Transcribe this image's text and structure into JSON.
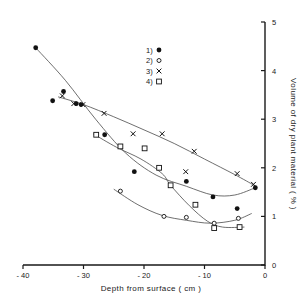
{
  "chart_data": {
    "type": "scatter",
    "title": "",
    "subtitle": "",
    "xlabel": "Depth from surface ( cm )",
    "ylabel": "Volume of dry plant material ( % )",
    "xlim": [
      -40,
      0
    ],
    "ylim": [
      0,
      5
    ],
    "xticks": [
      -40,
      -30,
      -20,
      -10,
      0
    ],
    "xtick_labels": [
      "- 40",
      "- 30",
      "- 20",
      "- 10",
      "0"
    ],
    "yticks": [
      0,
      1,
      2,
      3,
      4,
      5
    ],
    "ytick_labels": [
      "0",
      "1",
      "2",
      "3",
      "4",
      "5"
    ],
    "grid": false,
    "legend_position": "upper-center",
    "yaxis_position": "right",
    "legend": [
      {
        "key": "1)",
        "marker": "filled-circle",
        "series": "1"
      },
      {
        "key": "2)",
        "marker": "open-circle",
        "series": "2"
      },
      {
        "key": "3)",
        "marker": "cross",
        "series": "3"
      },
      {
        "key": "4)",
        "marker": "open-square",
        "series": "4"
      }
    ],
    "series": [
      {
        "name": "1",
        "marker": "filled-circle",
        "points": [
          {
            "x": -37.9,
            "y": 4.47
          },
          {
            "x": -35.1,
            "y": 3.38
          },
          {
            "x": -33.3,
            "y": 3.57
          },
          {
            "x": -31.2,
            "y": 3.32
          },
          {
            "x": -30.4,
            "y": 3.3
          },
          {
            "x": -26.5,
            "y": 2.68
          },
          {
            "x": -21.6,
            "y": 1.92
          },
          {
            "x": -13.0,
            "y": 1.72
          },
          {
            "x": -8.6,
            "y": 1.4
          },
          {
            "x": -4.6,
            "y": 1.16
          },
          {
            "x": -1.6,
            "y": 1.59
          }
        ],
        "curve": [
          {
            "x": -37.9,
            "y": 4.47
          },
          {
            "x": -33.0,
            "y": 3.8
          },
          {
            "x": -28.0,
            "y": 3.0
          },
          {
            "x": -23.0,
            "y": 2.3
          },
          {
            "x": -18.0,
            "y": 1.85
          },
          {
            "x": -13.0,
            "y": 1.62
          },
          {
            "x": -8.6,
            "y": 1.44
          },
          {
            "x": -5.0,
            "y": 1.44
          },
          {
            "x": -1.6,
            "y": 1.59
          }
        ]
      },
      {
        "name": "2",
        "marker": "open-circle",
        "points": [
          {
            "x": -23.9,
            "y": 1.52
          },
          {
            "x": -16.7,
            "y": 1.0
          },
          {
            "x": -13.0,
            "y": 0.98
          },
          {
            "x": -8.4,
            "y": 0.86
          },
          {
            "x": -4.4,
            "y": 0.96
          }
        ],
        "curve": [
          {
            "x": -25.0,
            "y": 1.56
          },
          {
            "x": -21.0,
            "y": 1.24
          },
          {
            "x": -17.0,
            "y": 1.02
          },
          {
            "x": -13.0,
            "y": 0.92
          },
          {
            "x": -9.0,
            "y": 0.86
          },
          {
            "x": -5.0,
            "y": 0.92
          },
          {
            "x": -2.2,
            "y": 1.06
          }
        ]
      },
      {
        "name": "3",
        "marker": "cross",
        "points": [
          {
            "x": -33.5,
            "y": 3.48
          },
          {
            "x": -31.6,
            "y": 3.32
          },
          {
            "x": -30.1,
            "y": 3.3
          },
          {
            "x": -26.6,
            "y": 3.12
          },
          {
            "x": -21.8,
            "y": 2.7
          },
          {
            "x": -17.0,
            "y": 2.7
          },
          {
            "x": -11.7,
            "y": 2.34
          },
          {
            "x": -13.1,
            "y": 1.92
          },
          {
            "x": -4.6,
            "y": 1.88
          },
          {
            "x": -1.9,
            "y": 1.66
          }
        ],
        "curve": [
          {
            "x": -34.2,
            "y": 3.46
          },
          {
            "x": -30.0,
            "y": 3.3
          },
          {
            "x": -25.0,
            "y": 3.05
          },
          {
            "x": -20.0,
            "y": 2.78
          },
          {
            "x": -15.0,
            "y": 2.5
          },
          {
            "x": -10.0,
            "y": 2.18
          },
          {
            "x": -5.0,
            "y": 1.86
          },
          {
            "x": -1.8,
            "y": 1.64
          }
        ]
      },
      {
        "name": "4",
        "marker": "open-square",
        "points": [
          {
            "x": -27.9,
            "y": 2.68
          },
          {
            "x": -23.9,
            "y": 2.44
          },
          {
            "x": -19.9,
            "y": 2.4
          },
          {
            "x": -17.5,
            "y": 2.0
          },
          {
            "x": -15.6,
            "y": 1.64
          },
          {
            "x": -11.5,
            "y": 1.24
          },
          {
            "x": -8.4,
            "y": 0.76
          },
          {
            "x": -4.2,
            "y": 0.78
          }
        ],
        "curve": [
          {
            "x": -28.4,
            "y": 2.7
          },
          {
            "x": -24.5,
            "y": 2.42
          },
          {
            "x": -20.5,
            "y": 2.18
          },
          {
            "x": -17.0,
            "y": 1.88
          },
          {
            "x": -15.6,
            "y": 1.64
          },
          {
            "x": -12.5,
            "y": 1.22
          },
          {
            "x": -9.5,
            "y": 0.9
          },
          {
            "x": -7.0,
            "y": 0.78
          },
          {
            "x": -3.4,
            "y": 0.78
          }
        ]
      }
    ]
  },
  "axes": {
    "x_title": "Depth from surface ( cm )",
    "y_title": "Volume of dry plant material ( % )"
  },
  "legend_items": [
    {
      "label": "1)"
    },
    {
      "label": "2)"
    },
    {
      "label": "3)"
    },
    {
      "label": "4)"
    }
  ],
  "x_tick_text": [
    "- 40",
    "- 30",
    "- 20",
    "- 10",
    "0"
  ],
  "y_tick_text": [
    "0",
    "1",
    "2",
    "3",
    "4",
    "5"
  ]
}
